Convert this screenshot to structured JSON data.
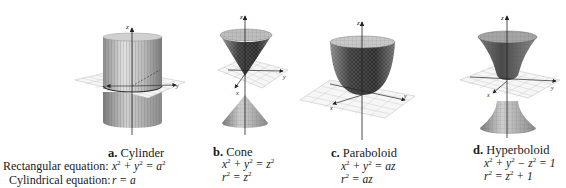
{
  "row_labels": {
    "rectangular": "Rectangular equation:",
    "cylindrical": "Cylindrical equation:"
  },
  "surfaces": [
    {
      "letter": "a.",
      "name": "Cylinder",
      "rect_eq": [
        {
          "t": "x"
        },
        {
          "s": "2"
        },
        {
          "t": " + y"
        },
        {
          "s": "2"
        },
        {
          "t": " = a"
        },
        {
          "s": "2"
        }
      ],
      "cyl_eq": [
        {
          "t": "r = a"
        }
      ],
      "rect_text": "x^2 + y^2 = a^2",
      "cyl_text": "r = a"
    },
    {
      "letter": "b.",
      "name": "Cone",
      "rect_eq": [
        {
          "t": "x"
        },
        {
          "s": "2"
        },
        {
          "t": " + y"
        },
        {
          "s": "2"
        },
        {
          "t": " = z"
        },
        {
          "s": "2"
        }
      ],
      "cyl_eq": [
        {
          "t": "r"
        },
        {
          "s": "2"
        },
        {
          "t": " = z"
        },
        {
          "s": "2"
        }
      ],
      "rect_text": "x^2 + y^2 = z^2",
      "cyl_text": "r^2 = z^2"
    },
    {
      "letter": "c.",
      "name": "Paraboloid",
      "rect_eq": [
        {
          "t": "x"
        },
        {
          "s": "2"
        },
        {
          "t": " + y"
        },
        {
          "s": "2"
        },
        {
          "t": " = az"
        }
      ],
      "cyl_eq": [
        {
          "t": "r"
        },
        {
          "s": "2"
        },
        {
          "t": " = az"
        }
      ],
      "rect_text": "x^2 + y^2 = az",
      "cyl_text": "r^2 = az"
    },
    {
      "letter": "d.",
      "name": "Hyperboloid",
      "rect_eq": [
        {
          "t": "x"
        },
        {
          "s": "2"
        },
        {
          "t": " + y"
        },
        {
          "s": "2"
        },
        {
          "t": " − z"
        },
        {
          "s": "2"
        },
        {
          "t": " = 1"
        }
      ],
      "cyl_eq": [
        {
          "t": "r"
        },
        {
          "s": "2"
        },
        {
          "t": " = z"
        },
        {
          "s": "2"
        },
        {
          "t": " + 1"
        }
      ],
      "rect_text": "x^2 + y^2 - z^2 = 1",
      "cyl_text": "r^2 = z^2 + 1"
    }
  ],
  "axis_labels": {
    "x": "x",
    "y": "y",
    "z": "z"
  },
  "colors": {
    "surface_light": "#d6d6d6",
    "surface_mid": "#a8a8a8",
    "surface_dark": "#3a3a3a",
    "grid": "#b5b5b5",
    "plane": "#f4f4f4",
    "axis": "#222222"
  }
}
